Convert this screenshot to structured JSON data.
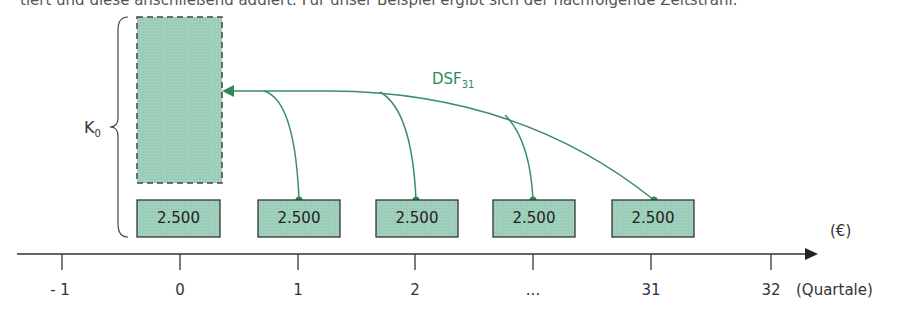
{
  "intro_text": "tiert und diese anschließend addiert. Für unser Beispiel ergibt sich der nachfolgende Zeitstrahl:",
  "present_value": {
    "label": "K",
    "subscript": "0"
  },
  "discount_factor": {
    "label": "DSF",
    "subscript": "31"
  },
  "payments": [
    {
      "period": "0",
      "value": "2.500"
    },
    {
      "period": "1",
      "value": "2.500"
    },
    {
      "period": "2",
      "value": "2.500"
    },
    {
      "period": "...",
      "value": "2.500"
    },
    {
      "period": "31",
      "value": "2.500"
    }
  ],
  "axis": {
    "ticks": [
      "- 1",
      "0",
      "1",
      "2",
      "...",
      "31",
      "32"
    ],
    "unit_label": "(Quartale)",
    "value_unit": "(€)"
  },
  "colors": {
    "box_fill": "#9ccdb9",
    "arrow_green": "#3a8f64",
    "axis": "#333333"
  }
}
